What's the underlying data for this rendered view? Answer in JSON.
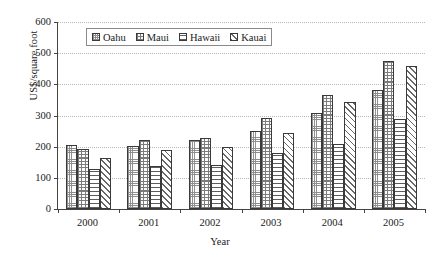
{
  "chart_data": {
    "type": "bar",
    "title": "",
    "subtitle": "",
    "xlabel": "Year",
    "ylabel": "US$/square foot",
    "categories": [
      "2000",
      "2001",
      "2002",
      "2003",
      "2004",
      "2005"
    ],
    "series": [
      {
        "name": "Oahu",
        "pattern": "fine-dotted-stipple",
        "values": [
          204,
          201,
          220,
          249,
          307,
          381
        ]
      },
      {
        "name": "Maui",
        "pattern": "coarse-checkered-stipple",
        "values": [
          194,
          223,
          227,
          293,
          367,
          474
        ]
      },
      {
        "name": "Hawaii",
        "pattern": "horizontal-lines",
        "values": [
          127,
          137,
          141,
          179,
          208,
          289
        ]
      },
      {
        "name": "Kauai",
        "pattern": "diagonal-hatch",
        "values": [
          165,
          188,
          198,
          243,
          343,
          458
        ]
      }
    ],
    "ylim": [
      0,
      600
    ],
    "ytick_step": 100,
    "yticks": [
      "0",
      "100",
      "200",
      "300",
      "400",
      "500",
      "600"
    ],
    "xticks": [
      "2000",
      "2001",
      "2002",
      "2003",
      "2004",
      "2005"
    ],
    "grid": "horizontal-dotted",
    "legend_position": "top-center-inside",
    "legend_entries": [
      "Oahu",
      "Maui",
      "Hawaii",
      "Kauai"
    ],
    "annotations": []
  },
  "axes": {
    "y_title": "US$/square foot",
    "x_title": "Year",
    "y_ticks": [
      {
        "label": "600",
        "value": 600
      },
      {
        "label": "500",
        "value": 500
      },
      {
        "label": "400",
        "value": 400
      },
      {
        "label": "300",
        "value": 300
      },
      {
        "label": "200",
        "value": 200
      },
      {
        "label": "100",
        "value": 100
      },
      {
        "label": "0",
        "value": 0
      }
    ],
    "x_ticks": [
      "2000",
      "2001",
      "2002",
      "2003",
      "2004",
      "2005"
    ]
  },
  "legend": {
    "items": [
      {
        "label": "Oahu"
      },
      {
        "label": "Maui"
      },
      {
        "label": "Hawaii"
      },
      {
        "label": "Kauai"
      }
    ]
  },
  "colors": {
    "axis": "#444444",
    "grid": "#b8b8b8",
    "bar_outline": "#3a3a3a",
    "background": "#ffffff",
    "text": "#1a1a1a"
  }
}
